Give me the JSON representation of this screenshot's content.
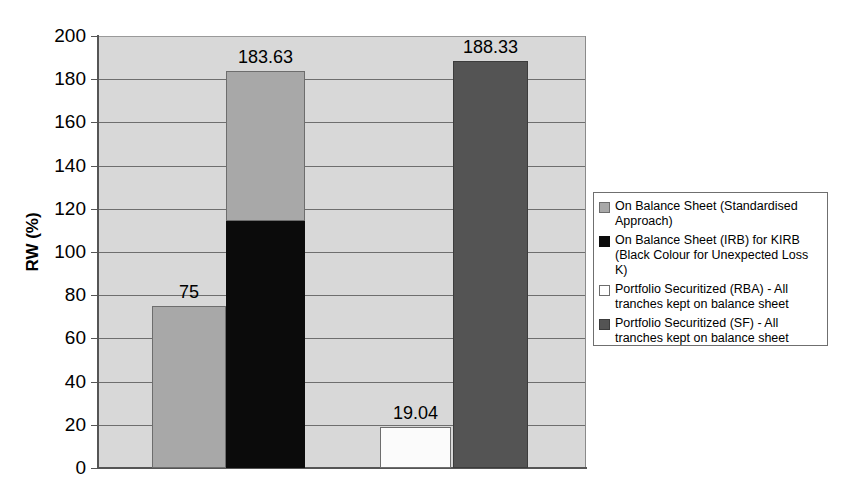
{
  "chart_data": {
    "type": "bar",
    "title": "",
    "subtitle": "",
    "xlabel": "",
    "ylabel": "RW (%)",
    "ylim": [
      0,
      200
    ],
    "ytick_step": 20,
    "yticks": [
      "200",
      "180",
      "160",
      "140",
      "120",
      "100",
      "80",
      "60",
      "40",
      "20",
      "0"
    ],
    "grid": true,
    "legend_position": "right",
    "categories": [
      "On Balance Sheet (Standardised Approach)",
      "On Balance Sheet (IRB) for KIRB",
      "Portfolio Securitized (RBA)",
      "Portfolio Securitized (SF)"
    ],
    "bars": [
      {
        "name": "On Balance Sheet (Standardised Approach)",
        "value": 75,
        "label": "75",
        "style": "bar-seg-a",
        "stacked": false
      },
      {
        "name": "On Balance Sheet (IRB) for KIRB",
        "value": 183.63,
        "label": "183.63",
        "style": "bar-seg-a",
        "stacked": true,
        "segments": [
          {
            "name": "Unexpected Loss K (black)",
            "from": 0,
            "to": 114.5,
            "style": "bar-seg-black"
          },
          {
            "name": "Remainder (grey)",
            "from": 114.5,
            "to": 183.63,
            "style": "bar-seg-a"
          }
        ]
      },
      {
        "name": "Portfolio Securitized (RBA) - All tranches kept on balance sheet",
        "value": 19.04,
        "label": "19.04",
        "style": "bar-seg-white",
        "stacked": false
      },
      {
        "name": "Portfolio Securitized (SF) - All tranches kept on balance sheet",
        "value": 188.33,
        "label": "188.33",
        "style": "bar-seg-dark",
        "stacked": false
      }
    ],
    "values": [
      75,
      183.63,
      19.04,
      188.33
    ],
    "data_labels": [
      "75",
      "183.63",
      "19.04",
      "188.33"
    ],
    "colors": {
      "series_standardised": "#a8a8a8",
      "series_irb_black": "#0b0b0b",
      "series_rba_white": "#fbfbfb",
      "series_sf_dark": "#545454",
      "plot_background": "#d8d8d8",
      "gridline": "#6e6e6e",
      "axis": "#555555"
    }
  },
  "legend": {
    "items": [
      {
        "swatch": "sw-a",
        "swatch_name": "legend-swatch-standardised",
        "label": "On Balance Sheet (Standardised\nApproach)"
      },
      {
        "swatch": "sw-black",
        "swatch_name": "legend-swatch-irb",
        "label": "On Balance Sheet (IRB) for KIRB\n(Black Colour for Unexpected Loss K)"
      },
      {
        "swatch": "sw-white",
        "swatch_name": "legend-swatch-rba",
        "label": "Portfolio Securitized (RBA) - All\ntranches kept on balance sheet"
      },
      {
        "swatch": "sw-dark",
        "swatch_name": "legend-swatch-sf",
        "label": "Portfolio Securitized (SF) - All\ntranches kept on balance sheet"
      }
    ]
  }
}
